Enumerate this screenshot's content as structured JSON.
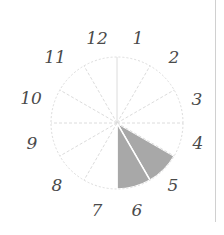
{
  "diagram": {
    "type": "clock-sector-diagram",
    "center": [
      117,
      123
    ],
    "radius": 66,
    "sectors": 12,
    "labels": [
      "12",
      "1",
      "2",
      "3",
      "4",
      "5",
      "6",
      "7",
      "8",
      "9",
      "10",
      "11"
    ],
    "label_positions": [
      [
        97,
        38
      ],
      [
        138,
        38
      ],
      [
        174,
        57
      ],
      [
        197,
        99
      ],
      [
        198,
        143
      ],
      [
        173,
        185
      ],
      [
        137,
        210
      ],
      [
        97,
        210
      ],
      [
        57,
        185
      ],
      [
        32,
        143
      ],
      [
        31,
        98
      ],
      [
        55,
        57
      ]
    ],
    "shaded_sectors": [
      "5",
      "6"
    ],
    "shade_color": "#a8a8a8",
    "grid_color": "#dcdcdc"
  }
}
